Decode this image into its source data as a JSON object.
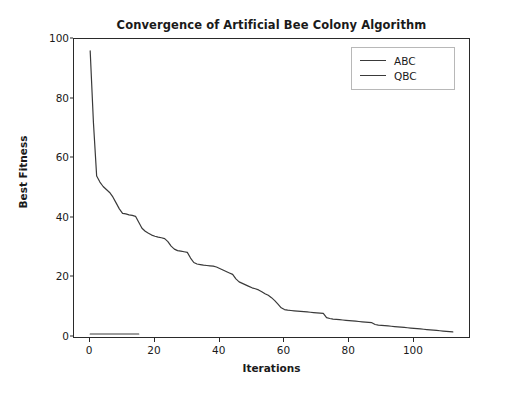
{
  "chart_data": {
    "type": "line",
    "title": "Convergence of Artificial Bee Colony Algorithm",
    "xlabel": "Iterations",
    "ylabel": "Best Fitness",
    "xlim": [
      -5,
      117
    ],
    "ylim": [
      0,
      100
    ],
    "grid": false,
    "legend_position": "upper right",
    "xticks": [
      0,
      20,
      40,
      60,
      80,
      100
    ],
    "yticks": [
      0,
      20,
      40,
      60,
      80,
      100
    ],
    "series": [
      {
        "name": "ABC",
        "color": "#3a3a3a",
        "x": [
          0,
          1,
          2,
          3,
          4,
          5,
          6,
          7,
          8,
          9,
          10,
          11,
          12,
          13,
          14,
          15,
          16,
          17,
          18,
          19,
          20,
          21,
          22,
          23,
          24,
          25,
          26,
          27,
          28,
          29,
          30,
          31,
          32,
          33,
          34,
          35,
          36,
          37,
          38,
          39,
          40,
          41,
          42,
          43,
          44,
          45,
          46,
          47,
          48,
          49,
          50,
          51,
          52,
          53,
          54,
          55,
          56,
          57,
          58,
          59,
          60,
          61,
          62,
          63,
          64,
          65,
          66,
          67,
          68,
          69,
          70,
          71,
          72,
          73,
          74,
          75,
          76,
          77,
          78,
          79,
          80,
          81,
          82,
          83,
          84,
          85,
          86,
          87,
          88,
          89,
          90,
          91,
          92,
          93,
          94,
          95,
          96,
          97,
          98,
          99,
          100,
          101,
          102,
          103,
          104,
          105,
          106,
          107,
          108,
          109,
          110,
          111,
          112
        ],
        "values": [
          96.0,
          72.0,
          54.0,
          52.0,
          50.5,
          49.5,
          48.5,
          47.0,
          45.0,
          43.0,
          41.5,
          41.3,
          41.0,
          40.8,
          40.5,
          38.5,
          36.5,
          35.5,
          34.8,
          34.2,
          33.8,
          33.5,
          33.3,
          33.0,
          32.0,
          30.5,
          29.5,
          29.0,
          28.8,
          28.6,
          28.4,
          26.5,
          25.0,
          24.5,
          24.3,
          24.1,
          24.0,
          23.9,
          23.8,
          23.5,
          23.0,
          22.5,
          22.0,
          21.5,
          21.0,
          19.5,
          18.5,
          18.0,
          17.5,
          17.0,
          16.5,
          16.2,
          15.8,
          15.2,
          14.5,
          14.0,
          13.2,
          12.2,
          11.0,
          9.8,
          9.2,
          9.0,
          8.9,
          8.8,
          8.7,
          8.6,
          8.5,
          8.4,
          8.3,
          8.2,
          8.1,
          8.0,
          7.9,
          6.5,
          6.2,
          6.0,
          5.9,
          5.8,
          5.7,
          5.6,
          5.5,
          5.4,
          5.3,
          5.2,
          5.1,
          5.0,
          4.9,
          4.8,
          4.2,
          4.0,
          3.9,
          3.8,
          3.7,
          3.6,
          3.5,
          3.4,
          3.3,
          3.2,
          3.1,
          3.0,
          2.9,
          2.8,
          2.7,
          2.6,
          2.5,
          2.4,
          2.3,
          2.2,
          2.1,
          2.0,
          1.9,
          1.8,
          1.7
        ]
      },
      {
        "name": "QBC",
        "color": "#3a3a3a",
        "x": [
          0,
          1,
          2,
          3,
          4,
          5,
          6,
          7,
          8,
          9,
          10,
          11,
          12,
          13,
          14,
          15
        ],
        "values": [
          1.0,
          1.0,
          1.0,
          1.0,
          1.0,
          1.0,
          1.0,
          1.0,
          1.0,
          1.0,
          1.0,
          1.0,
          1.0,
          1.0,
          1.0,
          1.0
        ]
      }
    ]
  },
  "axis": {
    "ytick_labels": [
      "100",
      "80",
      "60",
      "40",
      "20",
      "0"
    ],
    "xtick_labels": [
      "0",
      "20",
      "40",
      "60",
      "80",
      "100"
    ]
  },
  "legend": {
    "entries": [
      {
        "label": "ABC"
      },
      {
        "label": "QBC"
      }
    ]
  }
}
